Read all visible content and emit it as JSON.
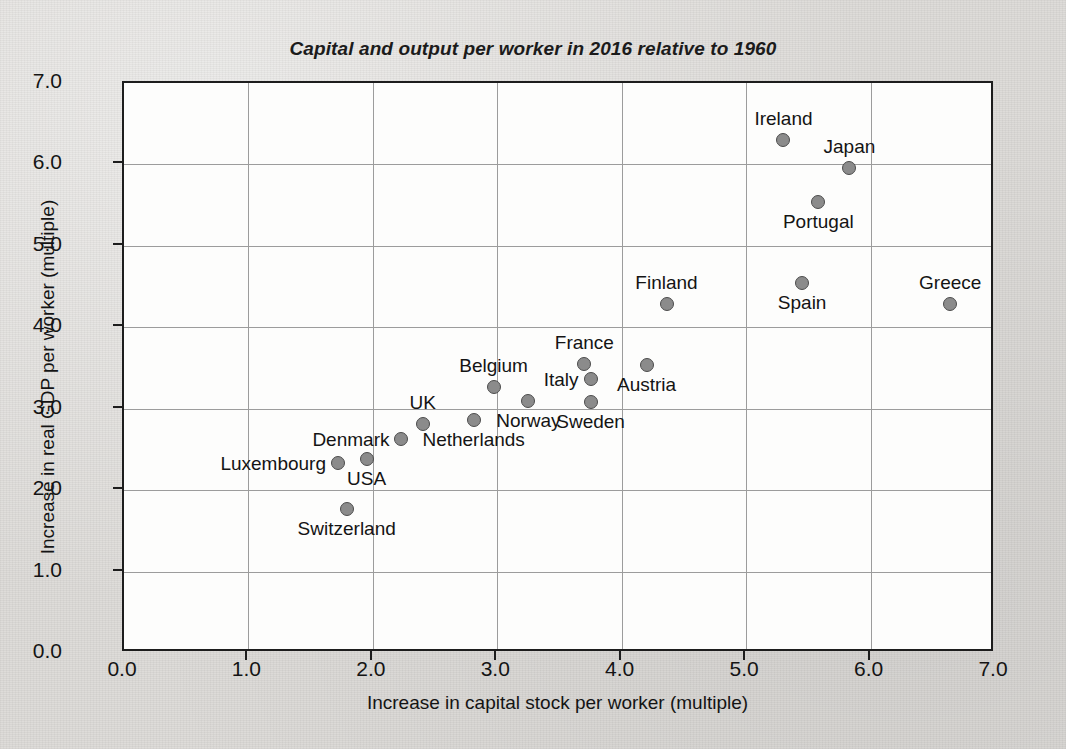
{
  "chart_data": {
    "type": "scatter",
    "title": "Capital and output per worker in 2016 relative to 1960",
    "xlabel": "Increase in capital stock per worker (multiple)",
    "ylabel": "Increase in real GDP per worker (multiple)",
    "xlim": [
      0.0,
      7.0
    ],
    "ylim": [
      0.0,
      7.0
    ],
    "xticks": [
      "0.0",
      "1.0",
      "2.0",
      "3.0",
      "4.0",
      "5.0",
      "6.0",
      "7.0"
    ],
    "yticks": [
      "0.0",
      "1.0",
      "2.0",
      "3.0",
      "4.0",
      "5.0",
      "6.0",
      "7.0"
    ],
    "grid": true,
    "legend": "none",
    "marker_color": "#8b8b8b",
    "marker_edge_color": "#4c4c4c",
    "points": [
      {
        "label": "Ireland",
        "x": 5.3,
        "y": 6.3,
        "label_pos": "above"
      },
      {
        "label": "Japan",
        "x": 5.83,
        "y": 5.96,
        "label_pos": "above"
      },
      {
        "label": "Portugal",
        "x": 5.58,
        "y": 5.54,
        "label_pos": "below"
      },
      {
        "label": "Spain",
        "x": 5.45,
        "y": 4.55,
        "label_pos": "below"
      },
      {
        "label": "Greece",
        "x": 6.64,
        "y": 4.28,
        "label_pos": "above"
      },
      {
        "label": "Finland",
        "x": 4.36,
        "y": 4.28,
        "label_pos": "above"
      },
      {
        "label": "Austria",
        "x": 4.2,
        "y": 3.54,
        "label_pos": "below"
      },
      {
        "label": "France",
        "x": 3.7,
        "y": 3.55,
        "label_pos": "above"
      },
      {
        "label": "Italy",
        "x": 3.75,
        "y": 3.36,
        "label_pos": "left"
      },
      {
        "label": "Sweden",
        "x": 3.75,
        "y": 3.08,
        "label_pos": "below"
      },
      {
        "label": "Norway",
        "x": 3.25,
        "y": 3.1,
        "label_pos": "below"
      },
      {
        "label": "Belgium",
        "x": 2.97,
        "y": 3.27,
        "label_pos": "above"
      },
      {
        "label": "Netherlands",
        "x": 2.81,
        "y": 2.86,
        "label_pos": "below"
      },
      {
        "label": "UK",
        "x": 2.4,
        "y": 2.81,
        "label_pos": "above"
      },
      {
        "label": "Denmark",
        "x": 2.23,
        "y": 2.63,
        "label_pos": "left"
      },
      {
        "label": "USA",
        "x": 1.95,
        "y": 2.38,
        "label_pos": "below"
      },
      {
        "label": "Luxembourg",
        "x": 1.72,
        "y": 2.33,
        "label_pos": "left"
      },
      {
        "label": "Switzerland",
        "x": 1.79,
        "y": 1.77,
        "label_pos": "below"
      }
    ]
  }
}
